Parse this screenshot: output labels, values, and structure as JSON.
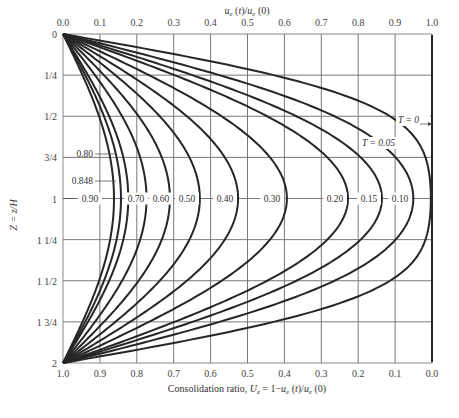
{
  "chart_data": {
    "type": "line",
    "title": "",
    "top_axis": {
      "label": "u_e(t)/u_e(0)",
      "ticks": [
        "0.0",
        "0.1",
        "0.2",
        "0.3",
        "0.4",
        "0.5",
        "0.6",
        "0.7",
        "0.8",
        "0.9",
        "1.0"
      ],
      "range": [
        0.0,
        1.0
      ]
    },
    "bottom_axis": {
      "label": "Consolidation ratio, U_z = 1−u_e(t)/u_e(0)",
      "ticks": [
        "1.0",
        "0.9",
        "0.8",
        "0.7",
        "0.6",
        "0.5",
        "0.4",
        "0.3",
        "0.2",
        "0.1",
        "0.0"
      ],
      "range": [
        1.0,
        0.0
      ]
    },
    "y_axis": {
      "label": "Z = z/H",
      "ticks": [
        "0",
        "1/4",
        "1/2",
        "3/4",
        "1",
        "1 1/4",
        "1 1/2",
        "1 3/4",
        "2"
      ],
      "range": [
        0,
        2
      ],
      "inverted": true
    },
    "grid": true,
    "series_label_prefix": "T",
    "series": [
      {
        "name": "T = 0",
        "T": 0,
        "u_at_Z1": 1.0,
        "label": "T = 0"
      },
      {
        "name": "T = 0.05",
        "T": 0.05,
        "u_at_Z1": 0.99,
        "label": "T = 0.05"
      },
      {
        "name": "T = 0.10",
        "T": 0.1,
        "u_at_Z1": 0.95,
        "label": "0.10"
      },
      {
        "name": "T = 0.15",
        "T": 0.15,
        "u_at_Z1": 0.86,
        "label": "0.15"
      },
      {
        "name": "T = 0.20",
        "T": 0.2,
        "u_at_Z1": 0.77,
        "label": "0.20"
      },
      {
        "name": "T = 0.30",
        "T": 0.3,
        "u_at_Z1": 0.6,
        "label": "0.30"
      },
      {
        "name": "T = 0.40",
        "T": 0.4,
        "u_at_Z1": 0.47,
        "label": "0.40"
      },
      {
        "name": "T = 0.50",
        "T": 0.5,
        "u_at_Z1": 0.37,
        "label": "0.50"
      },
      {
        "name": "T = 0.60",
        "T": 0.6,
        "u_at_Z1": 0.3,
        "label": "0.60"
      },
      {
        "name": "T = 0.70",
        "T": 0.7,
        "u_at_Z1": 0.22,
        "label": "0.70"
      },
      {
        "name": "T = 0.80",
        "T": 0.8,
        "u_at_Z1": 0.17,
        "label": "0.80"
      },
      {
        "name": "T = 0.848",
        "T": 0.848,
        "u_at_Z1": 0.16,
        "label": "0.848"
      },
      {
        "name": "T = 0.90",
        "T": 0.9,
        "u_at_Z1": 0.14,
        "label": "0.90"
      }
    ]
  },
  "labels": {
    "top_axis_title": "u",
    "top_axis_title_full": "u_e(t)/u_e(0)",
    "bottom_axis_title": "Consolidation ratio, U_z = 1−u_e(t)/u_e(0)",
    "y_axis_title": "Z = z/H",
    "t0_label": "T = 0",
    "t005_label": "T = 0.05",
    "inline_labels": [
      "0.90",
      "0.70",
      "0.60",
      "0.50",
      "0.40",
      "0.30",
      "0.20",
      "0.15",
      "0.10"
    ],
    "left_labels": [
      "0.80",
      "0.848"
    ]
  },
  "colors": {
    "curve": "#262626",
    "grid": "#777777",
    "text": "#333333"
  }
}
